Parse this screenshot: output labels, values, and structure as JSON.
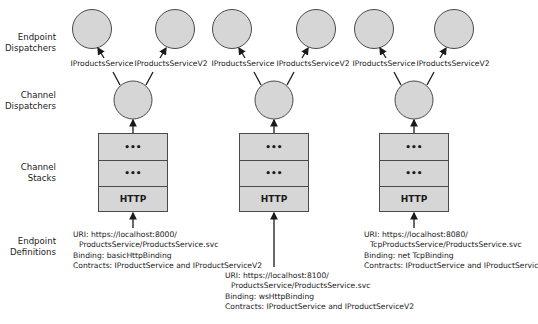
{
  "row_labels": [
    {
      "line1": "Endpoint",
      "line2": "Dispatchers"
    },
    {
      "line1": "Channel",
      "line2": "Dispatchers"
    },
    {
      "line1": "Channel",
      "line2": "Stacks"
    },
    {
      "line1": "Endpoint",
      "line2": "Definitions"
    }
  ],
  "columns": [
    {
      "endpoint_dispatchers": [
        {
          "label": "IProductsService"
        },
        {
          "label": "IProductsServiceV2"
        }
      ],
      "channel_stack": [
        "•••",
        "•••",
        "HTTP"
      ],
      "definition": {
        "uri_line1": "URI: https://localhost:8000/",
        "uri_line2": "ProductsService/ProductsService.svc",
        "binding": "Binding: basicHttpBinding",
        "contracts": "Contracts: IProductService and IProductServiceV2"
      }
    },
    {
      "endpoint_dispatchers": [
        {
          "label": "IProductsService"
        },
        {
          "label": "IProductsServiceV2"
        }
      ],
      "channel_stack": [
        "•••",
        "•••",
        "HTTP"
      ],
      "definition": {
        "uri_line1": "URI: https://localhost:8100/",
        "uri_line2": "ProductsService/ProductsService.svc",
        "binding": "Binding: wsHttpBinding",
        "contracts": "Contracts: IProductService and IProductServiceV2"
      }
    },
    {
      "endpoint_dispatchers": [
        {
          "label": "IProductsService"
        },
        {
          "label": "IProductsServiceV2"
        }
      ],
      "channel_stack": [
        "•••",
        "•••",
        "HTTP"
      ],
      "definition": {
        "uri_line1": "URI: https://localhost:8080/",
        "uri_line2": "TcpProductsService/ProductsService.svc",
        "binding": "Binding: net TcpBinding",
        "contracts": "Contracts: IProductService and IProductServiceV2"
      }
    }
  ],
  "colors": {
    "node_fill": "#d6d6d6",
    "node_stroke": "#4a4a4a",
    "arrow": "#1a1a1a"
  }
}
